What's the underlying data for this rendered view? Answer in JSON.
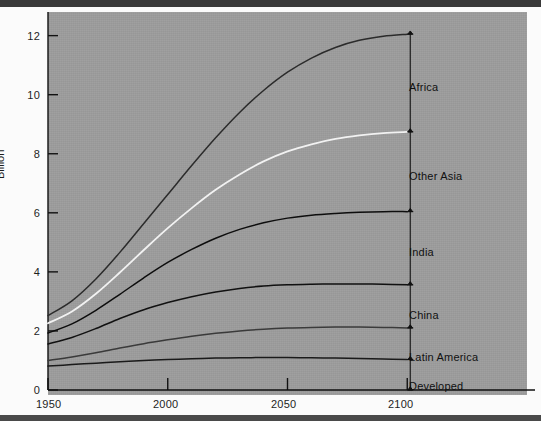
{
  "figure": {
    "ylabel": "Billion",
    "background_color": "#9c9c9c",
    "ytick_labels": [
      "12",
      "10",
      "8",
      "6",
      "4",
      "2",
      "0"
    ],
    "xtick_labels": [
      "1950",
      "2000",
      "2050",
      "2100"
    ],
    "series_labels": [
      "Africa",
      "Other Asia",
      "India",
      "China",
      "Latin America",
      "Developed"
    ]
  },
  "chart_data": {
    "type": "line",
    "title": "",
    "xlabel": "",
    "ylabel": "Billion",
    "xlim": [
      1950,
      2150
    ],
    "ylim": [
      0,
      12.8
    ],
    "xticks": [
      1950,
      2000,
      2050,
      2100
    ],
    "yticks": [
      0,
      2,
      4,
      6,
      8,
      10,
      12
    ],
    "grid": false,
    "legend_position": "right-bracket-annotations",
    "note": "Cumulative stacked population curves; each line is the running total of all regions at or below it. Bracket annotations at x=2100 delimit each region's band.",
    "x": [
      1950,
      1960,
      1970,
      1980,
      1990,
      2000,
      2010,
      2020,
      2030,
      2040,
      2050,
      2060,
      2070,
      2080,
      2090,
      2100
    ],
    "series": [
      {
        "name": "Developed",
        "color": "#1a1a1a",
        "cumulative_values": [
          0.81,
          0.86,
          0.91,
          0.96,
          1.0,
          1.03,
          1.06,
          1.08,
          1.09,
          1.1,
          1.1,
          1.09,
          1.08,
          1.07,
          1.05,
          1.03
        ],
        "band_top_2100": 1.03,
        "band_bottom_2100": 0.0
      },
      {
        "name": "Latin America",
        "color": "#3a3a3a",
        "cumulative_values": [
          1.0,
          1.12,
          1.26,
          1.42,
          1.57,
          1.7,
          1.82,
          1.92,
          2.0,
          2.06,
          2.1,
          2.12,
          2.13,
          2.13,
          2.12,
          2.1
        ],
        "band_top_2100": 2.1,
        "band_bottom_2100": 1.03
      },
      {
        "name": "China",
        "color": "#111111",
        "cumulative_values": [
          1.56,
          1.78,
          2.08,
          2.42,
          2.72,
          2.96,
          3.16,
          3.32,
          3.44,
          3.52,
          3.56,
          3.58,
          3.59,
          3.59,
          3.58,
          3.56
        ],
        "band_top_2100": 3.56,
        "band_bottom_2100": 2.1
      },
      {
        "name": "India",
        "color": "#0d0d0d",
        "cumulative_values": [
          1.93,
          2.24,
          2.7,
          3.24,
          3.8,
          4.32,
          4.76,
          5.14,
          5.44,
          5.66,
          5.82,
          5.92,
          5.98,
          6.02,
          6.04,
          6.04
        ],
        "band_top_2100": 6.04,
        "band_bottom_2100": 3.56
      },
      {
        "name": "Other Asia",
        "color": "#f2f2f2",
        "cumulative_values": [
          2.26,
          2.66,
          3.26,
          3.98,
          4.74,
          5.48,
          6.16,
          6.78,
          7.3,
          7.74,
          8.08,
          8.32,
          8.5,
          8.62,
          8.7,
          8.74
        ],
        "band_top_2100": 8.74,
        "band_bottom_2100": 6.04
      },
      {
        "name": "Africa",
        "color": "#2b2b2b",
        "cumulative_values": [
          2.52,
          3.02,
          3.76,
          4.66,
          5.64,
          6.62,
          7.6,
          8.54,
          9.4,
          10.14,
          10.76,
          11.24,
          11.6,
          11.84,
          11.98,
          12.05
        ],
        "band_top_2100": 12.05,
        "band_bottom_2100": 8.74
      }
    ],
    "brackets_at_x": 2100,
    "bracket_boundaries": [
      0.0,
      1.03,
      2.1,
      3.56,
      6.04,
      8.74,
      12.05
    ]
  }
}
